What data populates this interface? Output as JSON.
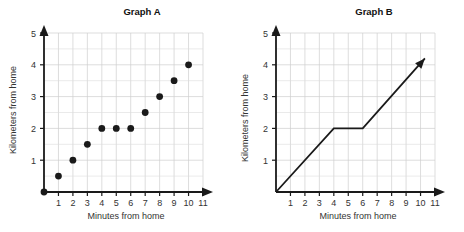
{
  "chart_data": [
    {
      "type": "scatter",
      "title": "Graph A",
      "xlabel": "Minutes from home",
      "ylabel": "Kilometers from home",
      "xlim": [
        0,
        11
      ],
      "ylim": [
        0,
        5
      ],
      "xticks": [
        1,
        2,
        3,
        4,
        5,
        6,
        7,
        8,
        9,
        10,
        11
      ],
      "yticks": [
        1,
        2,
        3,
        4,
        5
      ],
      "grid": true,
      "grid_x_step": 1,
      "grid_y_step": 0.5,
      "marker": "filled-circle",
      "marker_color": "#1a1a1a",
      "points": [
        {
          "x": 0,
          "y": 0
        },
        {
          "x": 1,
          "y": 0.5
        },
        {
          "x": 2,
          "y": 1
        },
        {
          "x": 3,
          "y": 1.5
        },
        {
          "x": 4,
          "y": 2
        },
        {
          "x": 5,
          "y": 2
        },
        {
          "x": 6,
          "y": 2
        },
        {
          "x": 7,
          "y": 2.5
        },
        {
          "x": 8,
          "y": 3
        },
        {
          "x": 9,
          "y": 3.5
        },
        {
          "x": 10,
          "y": 4
        }
      ]
    },
    {
      "type": "line",
      "title": "Graph B",
      "xlabel": "Minutes from home",
      "ylabel": "Kilometers from home",
      "xlim": [
        0,
        11
      ],
      "ylim": [
        0,
        5
      ],
      "xticks": [
        1,
        2,
        3,
        4,
        5,
        6,
        7,
        8,
        9,
        10,
        11
      ],
      "yticks": [
        1,
        2,
        3,
        4,
        5
      ],
      "grid": true,
      "grid_x_step": 1,
      "grid_y_step": 0.5,
      "line_color": "#1a1a1a",
      "arrow_end": true,
      "points": [
        {
          "x": 0,
          "y": 0
        },
        {
          "x": 4,
          "y": 2
        },
        {
          "x": 6,
          "y": 2
        },
        {
          "x": 10.3,
          "y": 4.2
        }
      ]
    }
  ]
}
